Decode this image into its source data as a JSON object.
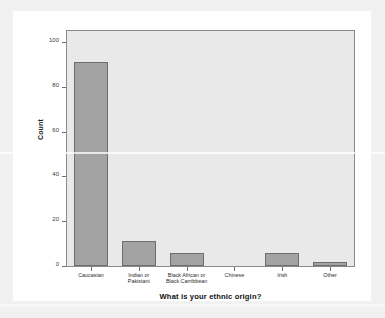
{
  "chart_data": {
    "type": "bar",
    "title": "",
    "xlabel": "What is your ethnic origin?",
    "ylabel": "Count",
    "categories": [
      "Caucasian",
      "Indian or\nPakistani",
      "Black African or\nBlack Carribbean",
      "Chinese",
      "Irish",
      "Other"
    ],
    "values": [
      91,
      11,
      6,
      0,
      6,
      2
    ],
    "ylim": [
      0,
      105
    ],
    "yticks": [
      0,
      20,
      40,
      60,
      80,
      100
    ],
    "ytick_labels": [
      "0",
      "20",
      "40",
      "60",
      "80",
      "100"
    ],
    "grid": false,
    "legend": null,
    "colors": {
      "bar_fill": "#a3a3a3",
      "bar_edge": "#6d6d6d",
      "plot_background": "#e9e9e9",
      "plot_border": "#8a8a8a",
      "figure_background": "#ffffff",
      "page_background": "#f1f1f1",
      "text": "#1a1a1a"
    }
  }
}
